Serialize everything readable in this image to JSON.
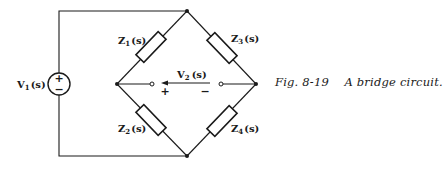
{
  "figure": {
    "number": "Fig. 8-19",
    "title": "A bridge circuit.",
    "caption_separator": "    "
  },
  "source": {
    "label": "V",
    "subscript": "1",
    "arg": "(s)",
    "plus": "+",
    "minus": "−"
  },
  "output_voltage": {
    "label": "V",
    "subscript": "2",
    "arg": "(s)",
    "plus": "+",
    "minus": "−"
  },
  "impedances": [
    {
      "label": "Z",
      "subscript": "1",
      "arg": "(s)"
    },
    {
      "label": "Z",
      "subscript": "2",
      "arg": "(s)"
    },
    {
      "label": "Z",
      "subscript": "3",
      "arg": "(s)"
    },
    {
      "label": "Z",
      "subscript": "4",
      "arg": "(s)"
    }
  ],
  "colors": {
    "ink": "#1a1a1a",
    "background": "#ffffff"
  }
}
